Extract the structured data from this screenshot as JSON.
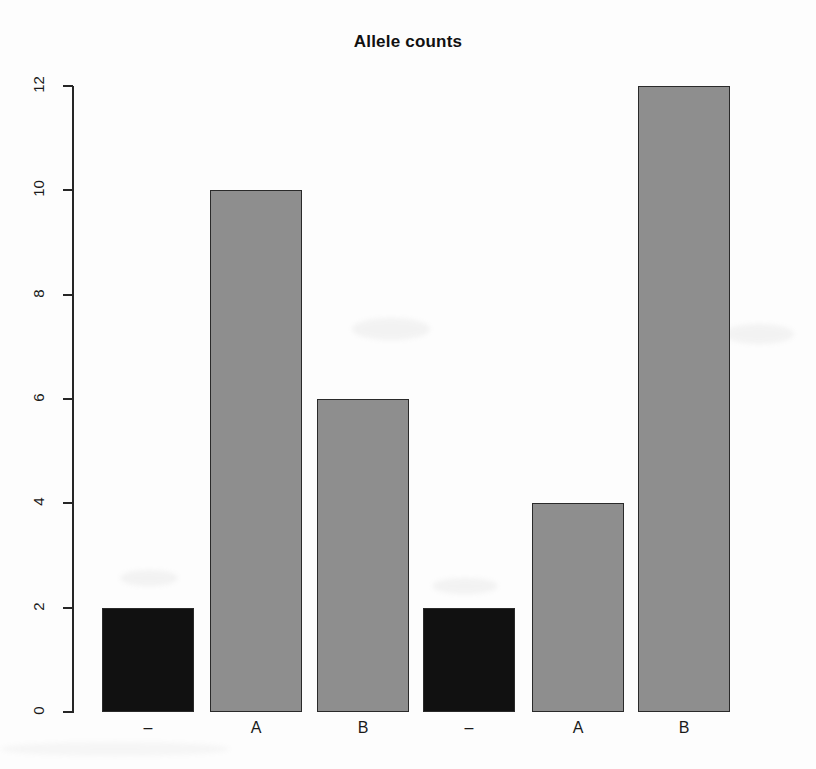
{
  "chart_data": {
    "type": "bar",
    "title": "Allele counts",
    "subtitle": "",
    "xlabel": "",
    "ylabel": "",
    "categories": [
      "–",
      "A",
      "B",
      "–",
      "A",
      "B"
    ],
    "values": [
      2,
      10,
      6,
      2,
      4,
      12
    ],
    "bar_colors": [
      "#111111",
      "#8e8e8e",
      "#8e8e8e",
      "#111111",
      "#8e8e8e",
      "#8e8e8e"
    ],
    "bar_border_color": "#2a2a2a",
    "ylim": [
      0,
      12
    ],
    "y_ticks": [
      0,
      2,
      4,
      6,
      8,
      10,
      12
    ],
    "y_tick_labels": [
      "0",
      "2",
      "4",
      "6",
      "8",
      "10",
      "12"
    ],
    "grid": false,
    "legend": null,
    "annotations": []
  },
  "figure": {
    "background": "#fdfdfd",
    "axis_color": "#262626",
    "text_color": "#1a1a1a"
  }
}
